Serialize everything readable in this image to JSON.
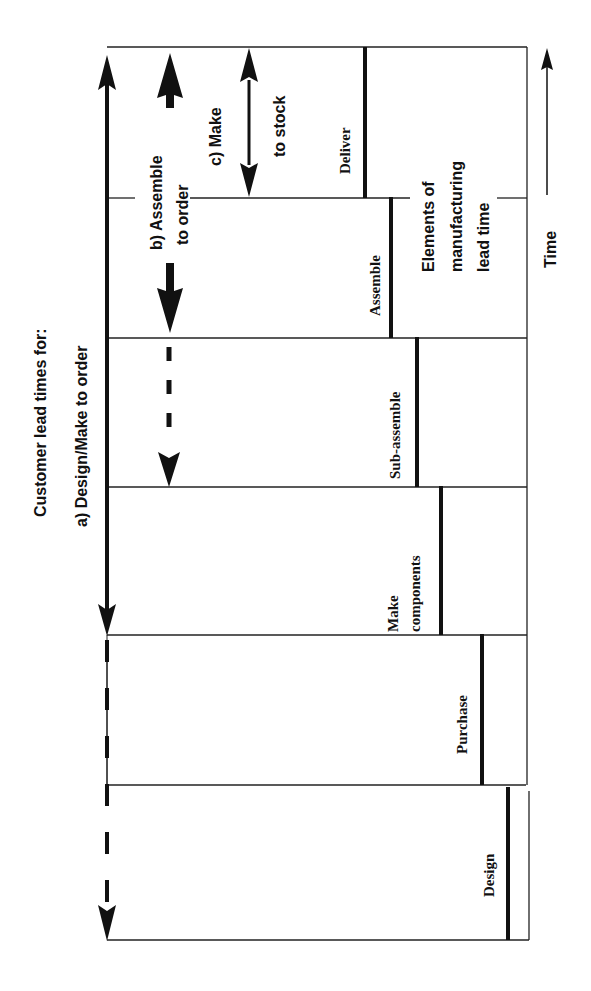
{
  "diagram": {
    "title": "Customer lead times for:",
    "orientation": "rotated -90deg (time flows upward)",
    "lead_time_types": [
      {
        "id": "a",
        "label": "a)  Design/Make to order"
      },
      {
        "id": "b",
        "label_line1": "b) Assemble",
        "label_line2": "to order"
      },
      {
        "id": "c",
        "label_line1": "c) Make",
        "label_line2": "to stock"
      }
    ],
    "elements_label": {
      "line1": "Elements of",
      "line2": "manufacturing",
      "line3": "lead time"
    },
    "time_axis_label": "Time",
    "stages": [
      {
        "name": "Deliver"
      },
      {
        "name": "Assemble"
      },
      {
        "name": "Sub-assemble"
      },
      {
        "name": "Make",
        "name_line2": "components"
      },
      {
        "name": "Purchase"
      },
      {
        "name": "Design"
      }
    ]
  }
}
